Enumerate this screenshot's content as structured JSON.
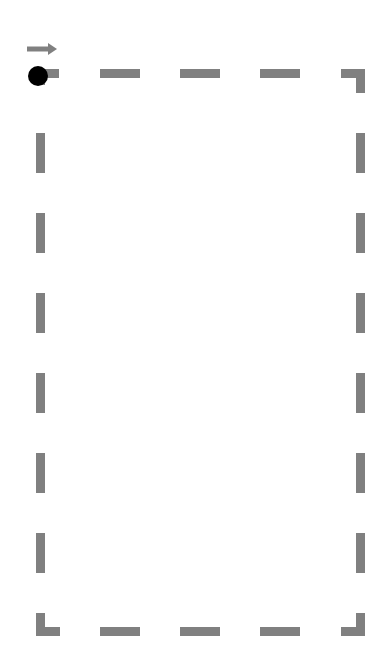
{
  "canvas": {
    "width": 391,
    "height": 662,
    "background": "#ffffff"
  },
  "path": {
    "color": "#808080",
    "stroke_width": 9,
    "dash_length": 40,
    "gap_length": 40,
    "rect": {
      "left": 36,
      "top": 69,
      "right": 365,
      "bottom": 636
    }
  },
  "start_marker": {
    "cx": 38,
    "cy": 76,
    "r": 10,
    "color": "#000000"
  },
  "direction_arrow": {
    "x1": 27,
    "x2": 57,
    "y": 49,
    "color": "#808080",
    "icon": "arrow-right-icon"
  }
}
